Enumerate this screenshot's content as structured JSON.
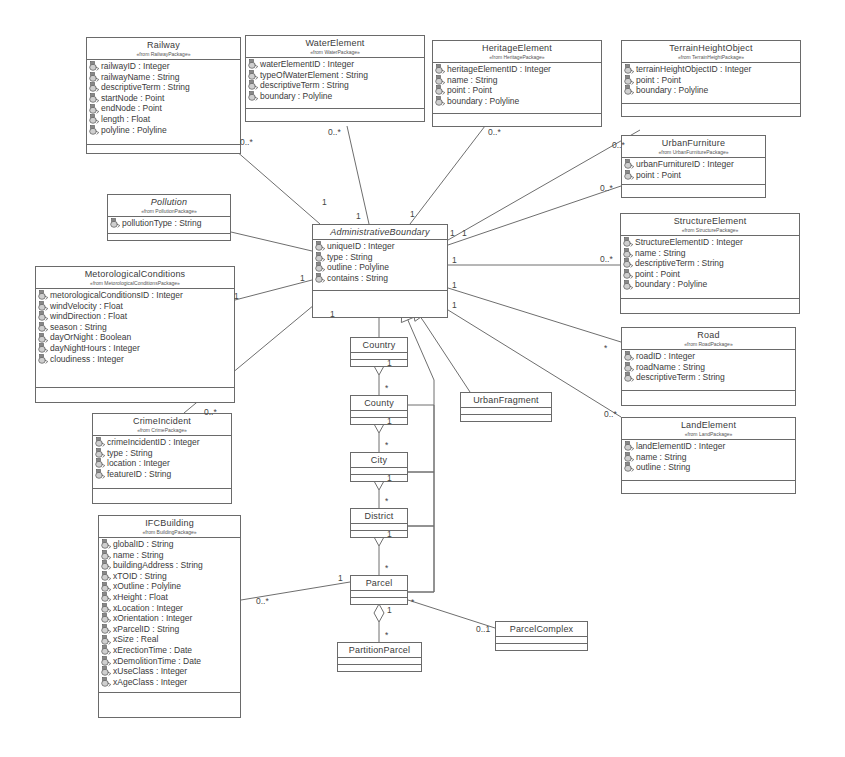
{
  "diagram": {
    "type": "uml-class-diagram",
    "classes": [
      {
        "id": "railway",
        "name": "Railway",
        "stereotype": "«from RailwayPackage»",
        "abstract": false,
        "x": 86,
        "y": 37,
        "w": 155,
        "attrs_h": 84,
        "ops_h": 8,
        "attributes": [
          "railwayID : Integer",
          "railwayName : String",
          "descriptiveTerm : String",
          "startNode : Point",
          "endNode : Point",
          "length : Float",
          "polyline : Polyline"
        ]
      },
      {
        "id": "waterelement",
        "name": "WaterElement",
        "stereotype": "«from WaterPackage»",
        "abstract": false,
        "x": 245,
        "y": 35,
        "w": 180,
        "attrs_h": 50,
        "ops_h": 12,
        "attributes": [
          "waterElementID : Integer",
          "typeOfWaterElement : String",
          "descriptiveTerm : String",
          "boundary : Polyline"
        ]
      },
      {
        "id": "heritageelement",
        "name": "HeritageElement",
        "stereotype": "«from HeritagePackage»",
        "abstract": false,
        "x": 432,
        "y": 40,
        "w": 170,
        "attrs_h": 50,
        "ops_h": 12,
        "attributes": [
          "heritageElementID : Integer",
          "name : String",
          "point : Point",
          "boundary : Polyline"
        ]
      },
      {
        "id": "terrainheightobject",
        "name": "TerrainHeightObject",
        "stereotype": "«from TerrainHeightPackage»",
        "abstract": false,
        "x": 621,
        "y": 40,
        "w": 180,
        "attrs_h": 40,
        "ops_h": 12,
        "attributes": [
          "terrainHeightObjectID : Integer",
          "point : Point",
          "boundary : Polyline"
        ]
      },
      {
        "id": "urbanfurniture",
        "name": "UrbanFurniture",
        "stereotype": "«from UrbanFurniturePackage»",
        "abstract": false,
        "x": 621,
        "y": 135,
        "w": 145,
        "attrs_h": 26,
        "ops_h": 12,
        "attributes": [
          "urbanFurnitureID : Integer",
          "point : Point"
        ]
      },
      {
        "id": "pollution",
        "name": "Pollution",
        "stereotype": "«from PollutionPackage»",
        "abstract": true,
        "x": 107,
        "y": 194,
        "w": 124,
        "attrs_h": 16,
        "ops_h": 6,
        "attributes": [
          "pollutionType : String"
        ]
      },
      {
        "id": "administrativeboundary",
        "name": "AdministrativeBoundary",
        "stereotype": "",
        "abstract": true,
        "x": 312,
        "y": 224,
        "w": 136,
        "attrs_h": 50,
        "ops_h": 26,
        "attributes": [
          "uniqueID : Integer",
          "type : String",
          "outline : Polyline",
          "contains : String"
        ]
      },
      {
        "id": "structureelement",
        "name": "StructureElement",
        "stereotype": "«from StructurePackage»",
        "abstract": false,
        "x": 620,
        "y": 213,
        "w": 180,
        "attrs_h": 62,
        "ops_h": 14,
        "attributes": [
          "StructureElementID : Integer",
          "name : String",
          "descriptiveTerm : String",
          "point : Point",
          "boundary : Polyline"
        ]
      },
      {
        "id": "metorologicalconditions",
        "name": "MetorologicalConditions",
        "stereotype": "«from MetorologicalConditionsPackage»",
        "abstract": false,
        "x": 35,
        "y": 266,
        "w": 200,
        "attrs_h": 98,
        "ops_h": 14,
        "attributes": [
          "metorologicalConditionsID : Integer",
          "windVelocity : Float",
          "windDirection : Float",
          "season : String",
          "dayOrNight : Boolean",
          "dayNightHours : Integer",
          "cloudiness : Integer"
        ]
      },
      {
        "id": "road",
        "name": "Road",
        "stereotype": "«from RoadPackage»",
        "abstract": false,
        "x": 621,
        "y": 327,
        "w": 175,
        "attrs_h": 40,
        "ops_h": 14,
        "attributes": [
          "roadID : Integer",
          "roadName : String",
          "descriptiveTerm : String"
        ]
      },
      {
        "id": "landelement",
        "name": "LandElement",
        "stereotype": "«from LandPackage»",
        "abstract": false,
        "x": 621,
        "y": 417,
        "w": 175,
        "attrs_h": 40,
        "ops_h": 12,
        "attributes": [
          "landElementID : Integer",
          "name : String",
          "outline : String"
        ]
      },
      {
        "id": "crimeincident",
        "name": "CrimeIncident",
        "stereotype": "«from CrimePackage»",
        "abstract": false,
        "x": 92,
        "y": 413,
        "w": 140,
        "attrs_h": 52,
        "ops_h": 14,
        "attributes": [
          "crimeIncidentID : Integer",
          "type : String",
          "location : Integer",
          "featureID : String"
        ]
      },
      {
        "id": "ifcbuilding",
        "name": "IFCBuilding",
        "stereotype": "«from BuildingPackage»",
        "abstract": false,
        "x": 98,
        "y": 515,
        "w": 143,
        "attrs_h": 154,
        "ops_h": 24,
        "attributes": [
          "globalID : String",
          "name : String",
          "buildingAddress : String",
          "xTOID : String",
          "xOutline : Polyline",
          "xHeight : Float",
          "xLocation : Integer",
          "xOrientation : Integer",
          "xParcelID : String",
          "xSize : Real",
          "xErectionTime : Date",
          "xDemolitionTime : Date",
          "xUseClass : Integer",
          "xAgeClass : Integer"
        ]
      },
      {
        "id": "country",
        "name": "Country",
        "stereotype": "",
        "abstract": false,
        "x": 350,
        "y": 337,
        "w": 58,
        "attrs_h": 6,
        "ops_h": 6,
        "attributes": []
      },
      {
        "id": "county",
        "name": "County",
        "stereotype": "",
        "abstract": false,
        "x": 350,
        "y": 395,
        "w": 58,
        "attrs_h": 6,
        "ops_h": 6,
        "attributes": []
      },
      {
        "id": "city",
        "name": "City",
        "stereotype": "",
        "abstract": false,
        "x": 350,
        "y": 452,
        "w": 58,
        "attrs_h": 6,
        "ops_h": 6,
        "attributes": []
      },
      {
        "id": "district",
        "name": "District",
        "stereotype": "",
        "abstract": false,
        "x": 350,
        "y": 508,
        "w": 58,
        "attrs_h": 6,
        "ops_h": 6,
        "attributes": []
      },
      {
        "id": "urbanfragment",
        "name": "UrbanFragment",
        "stereotype": "",
        "abstract": false,
        "x": 460,
        "y": 392,
        "w": 92,
        "attrs_h": 6,
        "ops_h": 6,
        "attributes": []
      },
      {
        "id": "parcel",
        "name": "Parcel",
        "stereotype": "",
        "abstract": false,
        "x": 350,
        "y": 575,
        "w": 58,
        "attrs_h": 6,
        "ops_h": 6,
        "attributes": []
      },
      {
        "id": "parcelcomplex",
        "name": "ParcelComplex",
        "stereotype": "",
        "abstract": false,
        "x": 495,
        "y": 621,
        "w": 93,
        "attrs_h": 6,
        "ops_h": 6,
        "attributes": []
      },
      {
        "id": "partitionparcel",
        "name": "PartitionParcel",
        "stereotype": "",
        "abstract": false,
        "x": 337,
        "y": 642,
        "w": 85,
        "attrs_h": 6,
        "ops_h": 6,
        "attributes": []
      }
    ],
    "associations": [
      {
        "from": "railway",
        "to": "administrativeboundary",
        "path": [
          [
            235,
            150
          ],
          [
            320,
            224
          ]
        ],
        "from_mult": "0..*",
        "to_mult": "1",
        "from_lbl": [
          240,
          138
        ],
        "to_lbl": [
          322,
          198
        ]
      },
      {
        "from": "waterelement",
        "to": "administrativeboundary",
        "path": [
          [
            347,
            126
          ],
          [
            369,
            224
          ]
        ],
        "from_mult": "0..*",
        "to_mult": "1",
        "from_lbl": [
          328,
          128
        ],
        "to_lbl": [
          356,
          212
        ]
      },
      {
        "from": "heritageelement",
        "to": "administrativeboundary",
        "path": [
          [
            485,
            126
          ],
          [
            410,
            224
          ]
        ],
        "from_mult": "0..*",
        "to_mult": "1",
        "from_lbl": [
          488,
          128
        ],
        "to_lbl": [
          410,
          210
        ]
      },
      {
        "from": "terrainheightobject",
        "to": "administrativeboundary",
        "path": [
          [
            640,
            130
          ],
          [
            448,
            240
          ]
        ],
        "from_mult": "0..*",
        "to_mult": "1",
        "from_lbl": [
          612,
          141
        ],
        "to_lbl": [
          450,
          229
        ]
      },
      {
        "from": "urbanfurniture",
        "to": "administrativeboundary",
        "path": [
          [
            621,
            186
          ],
          [
            448,
            245
          ]
        ],
        "from_mult": "0..*",
        "to_mult": "1",
        "from_lbl": [
          600,
          184
        ],
        "to_lbl": [
          462,
          229
        ]
      },
      {
        "from": "pollution",
        "to": "administrativeboundary",
        "path": [
          [
            231,
            232
          ],
          [
            312,
            251
          ]
        ],
        "from_mult": "",
        "to_mult": "",
        "from_lbl": [
          0,
          0
        ],
        "to_lbl": [
          0,
          0
        ]
      },
      {
        "from": "metorologicalconditions",
        "to": "administrativeboundary",
        "path": [
          [
            235,
            300
          ],
          [
            312,
            280
          ]
        ],
        "from_mult": "1",
        "to_mult": "1",
        "from_lbl": [
          234,
          292
        ],
        "to_lbl": [
          300,
          274
        ]
      },
      {
        "from": "structureelement",
        "to": "administrativeboundary",
        "path": [
          [
            620,
            265
          ],
          [
            448,
            265
          ]
        ],
        "from_mult": "0..*",
        "to_mult": "1",
        "from_lbl": [
          600,
          255
        ],
        "to_lbl": [
          452,
          256
        ]
      },
      {
        "from": "road",
        "to": "administrativeboundary",
        "path": [
          [
            621,
            342
          ],
          [
            448,
            288
          ]
        ],
        "from_mult": "*",
        "to_mult": "1",
        "from_lbl": [
          604,
          344
        ],
        "to_lbl": [
          452,
          281
        ]
      },
      {
        "from": "landelement",
        "to": "administrativeboundary",
        "path": [
          [
            621,
            417
          ],
          [
            440,
            305
          ]
        ],
        "from_mult": "0..*",
        "to_mult": "1",
        "from_lbl": [
          604,
          410
        ],
        "to_lbl": [
          452,
          301
        ]
      },
      {
        "from": "crimeincident",
        "to": "administrativeboundary",
        "path": [
          [
            184,
            413
          ],
          [
            320,
            300
          ]
        ],
        "from_mult": "0..*",
        "to_mult": "1",
        "from_lbl": [
          204,
          408
        ],
        "to_lbl": [
          330,
          310
        ]
      },
      {
        "from": "ifcbuilding",
        "to": "parcel",
        "path": [
          [
            241,
            600
          ],
          [
            350,
            582
          ]
        ],
        "from_mult": "0..*",
        "to_mult": "1",
        "from_lbl": [
          256,
          597
        ],
        "to_lbl": [
          338,
          574
        ]
      },
      {
        "from": "parcel",
        "to": "parcelcomplex",
        "path": [
          [
            408,
            600
          ],
          [
            495,
            628
          ]
        ],
        "from_mult": "*",
        "to_mult": "0..1",
        "from_lbl": [
          411,
          598
        ],
        "to_lbl": [
          476,
          625
        ]
      }
    ],
    "generalizations": [
      {
        "from": "country",
        "to": "administrativeboundary",
        "path": [
          [
            379,
            337
          ],
          [
            379,
            310
          ]
        ],
        "tip": [
          379,
          294
        ]
      },
      {
        "from": "urbanfragment",
        "to": "administrativeboundary",
        "path": [
          [
            470,
            392
          ],
          [
            424,
            322
          ]
        ],
        "tip": [
          412,
          305
        ]
      },
      {
        "from": "county-city-district-parcel",
        "to": "administrativeboundary",
        "path": [
          [
            408,
            405
          ],
          [
            434,
            405
          ],
          [
            434,
            472
          ],
          [
            408,
            472
          ],
          [
            434,
            472
          ],
          [
            434,
            526
          ],
          [
            408,
            526
          ],
          [
            434,
            526
          ],
          [
            434,
            592
          ],
          [
            408,
            592
          ],
          [
            434,
            592
          ],
          [
            434,
            380
          ],
          [
            410,
            325
          ]
        ],
        "tip": [
          402,
          306
        ]
      }
    ],
    "aggregations": [
      {
        "whole": "country",
        "part": "county",
        "x": 379,
        "y1": 357,
        "y2": 395,
        "whole_mult": "1",
        "part_mult": "*"
      },
      {
        "whole": "county",
        "part": "city",
        "x": 379,
        "y1": 415,
        "y2": 452,
        "whole_mult": "1",
        "part_mult": "*"
      },
      {
        "whole": "city",
        "part": "district",
        "x": 379,
        "y1": 472,
        "y2": 508,
        "whole_mult": "1",
        "part_mult": "*"
      },
      {
        "whole": "district",
        "part": "parcel",
        "x": 379,
        "y1": 528,
        "y2": 575,
        "whole_mult": "1",
        "part_mult": "*"
      },
      {
        "whole": "parcel",
        "part": "partitionparcel",
        "x": 379,
        "y1": 604,
        "y2": 642,
        "whole_mult": "1",
        "part_mult": "*"
      }
    ]
  }
}
